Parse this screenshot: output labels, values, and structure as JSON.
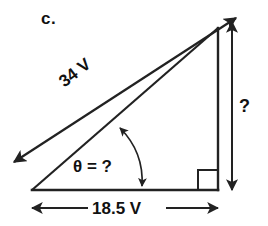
{
  "figure": {
    "part_label": "c.",
    "type": "right-triangle-vector-diagram",
    "stroke_color": "#222222",
    "background_color": "#ffffff",
    "labels": {
      "hypotenuse": "34 V",
      "angle": "θ = ?",
      "base": "18.5 V",
      "height": "?"
    },
    "markers": {
      "right_angle": "right-angle-square",
      "angle_arc": "double-headed-arc"
    },
    "geometry": {
      "apex": [
        218,
        28
      ],
      "left_vertex": [
        32,
        190
      ],
      "right_vertex": [
        218,
        190
      ],
      "vector_tail": [
        14,
        162
      ],
      "vector_head": [
        236,
        18
      ],
      "base_dim_y": 208,
      "height_dim_x": 232
    },
    "quantities": {
      "hypotenuse_value": 34,
      "hypotenuse_unit": "V",
      "base_value": 18.5,
      "base_unit": "V",
      "height_value": "?",
      "angle_value": "?"
    }
  }
}
